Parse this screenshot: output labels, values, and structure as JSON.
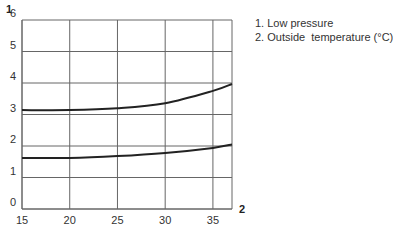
{
  "chart_data": {
    "type": "line",
    "title": "",
    "xlabel": "2",
    "ylabel": "1",
    "xlim": [
      15,
      37
    ],
    "ylim": [
      0,
      6
    ],
    "grid": true,
    "legend_position": "top-right (outside plot)",
    "x_ticks": [
      "15",
      "20",
      "25",
      "30",
      "35"
    ],
    "y_ticks": [
      "0",
      "1",
      "2",
      "3",
      "4",
      "5",
      "6"
    ],
    "legend": [
      "1. Low pressure",
      "2. Outside  temperature (°C)"
    ],
    "x": [
      15,
      20,
      25,
      30,
      35,
      37
    ],
    "series": [
      {
        "name": "upper curve",
        "values": [
          3.14,
          3.14,
          3.2,
          3.36,
          3.75,
          3.97
        ]
      },
      {
        "name": "lower curve",
        "values": [
          1.62,
          1.62,
          1.68,
          1.78,
          1.94,
          2.05
        ]
      }
    ]
  },
  "labels": {
    "y_axis_tag": "1",
    "x_axis_tag": "2",
    "legend_1": "1. Low pressure",
    "legend_2": "2. Outside  temperature (°C)"
  }
}
